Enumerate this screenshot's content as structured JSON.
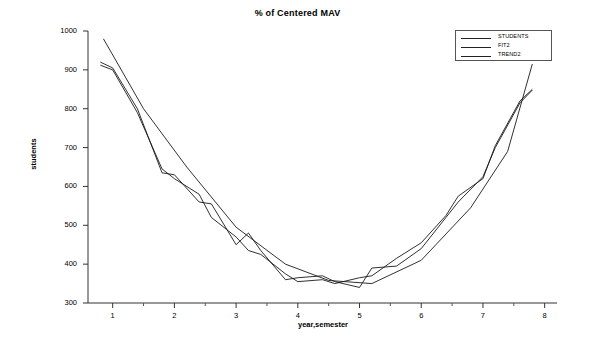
{
  "chart_data": {
    "type": "line",
    "title": "% of Centered MAV",
    "xlabel": "year,semester",
    "ylabel": "students",
    "xlim": [
      0.6,
      8.2
    ],
    "ylim": [
      300,
      1000
    ],
    "grid": false,
    "legend_position": "top-right",
    "xticks": [
      1,
      2,
      3,
      4,
      5,
      6,
      7,
      8
    ],
    "yticks": [
      300,
      400,
      500,
      600,
      700,
      800,
      900,
      1000
    ],
    "series": [
      {
        "name": "STUDENTS",
        "x": [
          0.8,
          1.0,
          1.4,
          1.8,
          2.0,
          2.4,
          2.6,
          3.0,
          3.2,
          3.4,
          3.8,
          4.0,
          4.4,
          4.6,
          5.0,
          5.2,
          5.6,
          6.0,
          6.4,
          6.6,
          7.0,
          7.2,
          7.6,
          7.8
        ],
        "values": [
          920,
          905,
          800,
          635,
          630,
          560,
          555,
          450,
          480,
          435,
          360,
          365,
          370,
          355,
          340,
          390,
          395,
          440,
          520,
          560,
          625,
          700,
          815,
          848
        ]
      },
      {
        "name": "FIT2",
        "x": [
          0.8,
          1.0,
          1.4,
          1.8,
          2.0,
          2.4,
          2.6,
          3.0,
          3.2,
          3.4,
          3.8,
          4.0,
          4.4,
          4.6,
          5.0,
          5.2,
          5.6,
          6.0,
          6.4,
          6.6,
          7.0,
          7.2,
          7.6,
          7.8
        ],
        "values": [
          912,
          900,
          790,
          645,
          620,
          580,
          520,
          470,
          435,
          425,
          375,
          355,
          360,
          350,
          365,
          370,
          415,
          455,
          525,
          575,
          620,
          705,
          820,
          850
        ]
      },
      {
        "name": "TREND2",
        "x": [
          0.85,
          1.5,
          2.2,
          3.0,
          3.8,
          4.5,
          5.2,
          6.0,
          6.8,
          7.4,
          7.8
        ],
        "values": [
          980,
          800,
          650,
          495,
          400,
          358,
          350,
          410,
          545,
          690,
          915
        ]
      }
    ]
  },
  "legend": {
    "items": [
      {
        "label": "STUDENTS"
      },
      {
        "label": "FIT2"
      },
      {
        "label": "TREND2"
      }
    ]
  },
  "axes": {
    "y_tick_labels": [
      "1000",
      "900",
      "800",
      "700",
      "600",
      "500",
      "400",
      "300"
    ],
    "x_tick_labels": [
      "1",
      "2",
      "3",
      "4",
      "5",
      "6",
      "7",
      "8"
    ]
  }
}
